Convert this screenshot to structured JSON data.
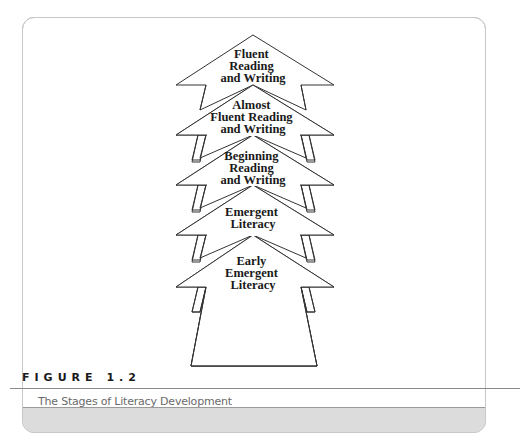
{
  "figure": {
    "number_label": "FIGURE 1.2",
    "caption": "The Stages of Literacy Development"
  },
  "diagram": {
    "type": "stacked-arrows",
    "direction": "up",
    "stages": [
      {
        "id": "fluent",
        "lines": [
          "Fluent",
          "Reading",
          "and Writing"
        ]
      },
      {
        "id": "almost-fluent",
        "lines": [
          "Almost",
          "Fluent Reading",
          "and Writing"
        ]
      },
      {
        "id": "beginning",
        "lines": [
          "Beginning",
          "Reading",
          "and Writing"
        ]
      },
      {
        "id": "emergent",
        "lines": [
          "Emergent",
          "Literacy"
        ]
      },
      {
        "id": "early-emergent",
        "lines": [
          "Early",
          "Emergent",
          "Literacy"
        ]
      }
    ],
    "colors": {
      "stroke": "#333333",
      "fill": "#ffffff",
      "caption_band": "#dcdcdc",
      "caption_text": "#6a6a6a"
    }
  }
}
